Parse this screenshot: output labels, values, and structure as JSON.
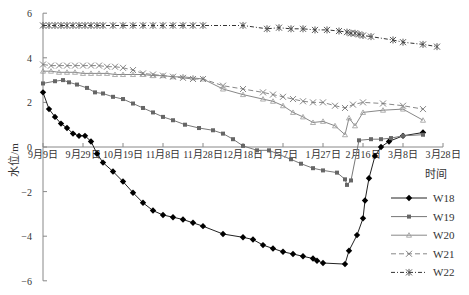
{
  "chart_data": {
    "type": "line",
    "title": "",
    "xlabel": "时间",
    "ylabel": "水位/m",
    "ylim": [
      -6,
      6
    ],
    "yticks": [
      6,
      4,
      2,
      0,
      -2,
      -4,
      -6
    ],
    "xlim_days": [
      0,
      200
    ],
    "xtick_labels": [
      "9月9日",
      "9月29日",
      "10月19日",
      "11月8日",
      "11月28日",
      "12月18日",
      "1月7日",
      "1月27日",
      "2月16日",
      "3月8日",
      "3月28日"
    ],
    "xtick_days": [
      0,
      20,
      40,
      60,
      80,
      100,
      120,
      140,
      160,
      180,
      200
    ],
    "grid": false,
    "legend_position": "lower right",
    "series": [
      {
        "name": "W18",
        "marker": "diamond",
        "line": "solid",
        "x_days": [
          0,
          3,
          6,
          9,
          12,
          15,
          18,
          21,
          24,
          27,
          30,
          35,
          40,
          45,
          50,
          55,
          60,
          65,
          70,
          75,
          80,
          90,
          100,
          105,
          110,
          115,
          120,
          125,
          130,
          135,
          137,
          140,
          151,
          153,
          157,
          160,
          161,
          163,
          166,
          169,
          173,
          180,
          190
        ],
        "values": [
          2.45,
          1.7,
          1.35,
          1.05,
          0.85,
          0.6,
          0.5,
          0.5,
          0.25,
          -0.3,
          -0.7,
          -1.1,
          -1.55,
          -2.05,
          -2.5,
          -2.85,
          -3.05,
          -3.15,
          -3.25,
          -3.4,
          -3.55,
          -3.9,
          -4.05,
          -4.15,
          -4.4,
          -4.55,
          -4.7,
          -4.8,
          -4.9,
          -5.0,
          -5.1,
          -5.2,
          -5.25,
          -4.65,
          -3.95,
          -3.2,
          -2.4,
          -1.4,
          -0.4,
          0.0,
          0.25,
          0.5,
          0.65
        ]
      },
      {
        "name": "W19",
        "marker": "square",
        "line": "solid",
        "x_days": [
          0,
          6,
          10,
          13,
          17,
          22,
          26,
          30,
          35,
          40,
          45,
          50,
          55,
          60,
          65,
          71,
          78,
          85,
          90,
          95,
          100,
          107,
          113,
          124,
          129,
          135,
          140,
          147,
          151,
          152,
          154,
          158,
          164,
          169,
          174,
          180,
          190
        ],
        "values": [
          2.85,
          2.95,
          3.0,
          2.9,
          2.8,
          2.65,
          2.45,
          2.4,
          2.25,
          2.15,
          1.95,
          1.75,
          1.55,
          1.35,
          1.2,
          1.0,
          0.85,
          0.75,
          0.6,
          0.35,
          0.05,
          -0.15,
          -0.15,
          -0.55,
          -0.75,
          -0.95,
          -1.05,
          -1.15,
          -1.45,
          -1.7,
          -1.5,
          0.3,
          0.35,
          0.35,
          0.4,
          0.5,
          0.55
        ]
      },
      {
        "name": "W20",
        "marker": "triangle",
        "line": "solid",
        "x_days": [
          0,
          4,
          8,
          12,
          16,
          20,
          24,
          28,
          32,
          36,
          40,
          45,
          50,
          55,
          60,
          65,
          70,
          75,
          80,
          90,
          100,
          110,
          115,
          120,
          125,
          130,
          135,
          140,
          146,
          151,
          153,
          156,
          160,
          170,
          180,
          190
        ],
        "values": [
          3.4,
          3.4,
          3.35,
          3.35,
          3.35,
          3.3,
          3.3,
          3.3,
          3.3,
          3.25,
          3.25,
          3.25,
          3.25,
          3.2,
          3.2,
          3.15,
          3.15,
          3.1,
          3.05,
          2.6,
          2.35,
          2.15,
          2.05,
          1.85,
          1.55,
          1.35,
          1.1,
          1.15,
          0.95,
          0.55,
          1.3,
          0.95,
          1.55,
          1.65,
          1.7,
          1.2
        ]
      },
      {
        "name": "W21",
        "marker": "x",
        "line": "dashed",
        "x_days": [
          0,
          4,
          8,
          12,
          16,
          20,
          24,
          28,
          32,
          36,
          40,
          45,
          50,
          55,
          60,
          65,
          70,
          75,
          80,
          90,
          100,
          110,
          115,
          120,
          125,
          130,
          135,
          140,
          146,
          151,
          155,
          160,
          170,
          180,
          190
        ],
        "values": [
          3.7,
          3.65,
          3.65,
          3.65,
          3.65,
          3.65,
          3.65,
          3.65,
          3.6,
          3.6,
          3.55,
          3.45,
          3.3,
          3.25,
          3.2,
          3.15,
          3.1,
          3.05,
          3.05,
          2.75,
          2.6,
          2.45,
          2.35,
          2.25,
          2.15,
          2.05,
          2.0,
          2.0,
          1.85,
          1.75,
          1.9,
          2.0,
          1.95,
          1.85,
          1.7
        ]
      },
      {
        "name": "W22",
        "marker": "asterisk",
        "line": "dash-dot",
        "x_days": [
          0,
          3,
          6,
          9,
          12,
          15,
          18,
          21,
          24,
          27,
          30,
          35,
          40,
          45,
          50,
          55,
          60,
          65,
          70,
          75,
          80,
          100,
          112,
          118,
          124,
          130,
          136,
          142,
          148,
          152,
          154,
          156,
          158,
          160,
          164,
          175,
          180,
          190,
          197
        ],
        "values": [
          5.45,
          5.45,
          5.45,
          5.45,
          5.45,
          5.45,
          5.45,
          5.45,
          5.45,
          5.45,
          5.45,
          5.45,
          5.45,
          5.45,
          5.45,
          5.45,
          5.45,
          5.45,
          5.45,
          5.45,
          5.45,
          5.45,
          5.3,
          5.35,
          5.3,
          5.3,
          5.25,
          5.25,
          5.2,
          5.15,
          5.1,
          5.1,
          5.05,
          5.0,
          4.95,
          4.8,
          4.7,
          4.6,
          4.5
        ]
      }
    ]
  },
  "legend": {
    "items": [
      {
        "label": "W18"
      },
      {
        "label": "W19"
      },
      {
        "label": "W20"
      },
      {
        "label": "W21"
      },
      {
        "label": "W22"
      }
    ]
  },
  "axes": {
    "xlabel": "时间",
    "ylabel": "水位/m"
  }
}
